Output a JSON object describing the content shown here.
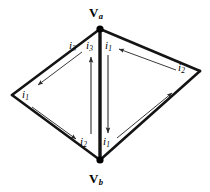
{
  "figure": {
    "type": "circuit-graph-diagram",
    "background_color": "#ffffff",
    "stroke_color": "#1a1a1a",
    "arrow_color": "#3a3a3a"
  },
  "nodes": [
    {
      "id": "va",
      "name": "node-va",
      "symbol": "V",
      "subscript": "a",
      "x": 100,
      "y": 29,
      "label_x": 89,
      "label_y": 7
    },
    {
      "id": "vb",
      "name": "node-vb",
      "symbol": "V",
      "subscript": "b",
      "x": 100,
      "y": 160,
      "label_x": 89,
      "label_y": 172
    },
    {
      "id": "vleft",
      "name": "node-left",
      "symbol": "",
      "subscript": "",
      "x": 12,
      "y": 95
    },
    {
      "id": "vright",
      "name": "node-right",
      "symbol": "",
      "subscript": "",
      "x": 200,
      "y": 71
    }
  ],
  "edges": [
    {
      "id": "edge-va-left",
      "from": "va",
      "to": "vleft",
      "x1": 100,
      "y1": 29,
      "x2": 12,
      "y2": 95
    },
    {
      "id": "edge-left-vb",
      "from": "vleft",
      "to": "vb",
      "x1": 12,
      "y1": 95,
      "x2": 100,
      "y2": 160
    },
    {
      "id": "edge-va-right",
      "from": "va",
      "to": "vright",
      "x1": 100,
      "y1": 29,
      "x2": 200,
      "y2": 71
    },
    {
      "id": "edge-right-vb",
      "from": "vright",
      "to": "vb",
      "x1": 200,
      "y1": 71,
      "x2": 100,
      "y2": 160
    },
    {
      "id": "edge-va-vb",
      "from": "va",
      "to": "vb",
      "x1": 100,
      "y1": 29,
      "x2": 100,
      "y2": 160
    }
  ],
  "currents": [
    {
      "id": "current-upper-left",
      "name": "current-arrow-upper-left",
      "symbol": "i",
      "subscript": "3",
      "direction": "down-left",
      "x1": 82,
      "y1": 52,
      "x2": 38,
      "y2": 85,
      "label_x": 72,
      "label_y": 42
    },
    {
      "id": "current-lower-left",
      "name": "current-arrow-lower-left",
      "symbol": "i",
      "subscript": "2",
      "direction": "down-right",
      "x1": 32,
      "y1": 107,
      "x2": 76,
      "y2": 139,
      "label_x": 82,
      "label_y": 138
    },
    {
      "id": "current-upper-right",
      "name": "current-arrow-upper-right",
      "symbol": "i",
      "subscript": "2",
      "direction": "up-left",
      "x1": 176,
      "y1": 70,
      "x2": 119,
      "y2": 49,
      "label_x": 176,
      "label_y": 66
    },
    {
      "id": "current-lower-right",
      "name": "current-arrow-lower-right",
      "symbol": "i",
      "subscript": "1",
      "direction": "up-right",
      "x1": 117,
      "y1": 138,
      "x2": 172,
      "y2": 93,
      "label_x": 105,
      "label_y": 138
    },
    {
      "id": "current-center-left",
      "name": "current-arrow-center-up",
      "symbol": "i",
      "subscript": "3",
      "direction": "up",
      "x1": 91,
      "y1": 134,
      "x2": 91,
      "y2": 57,
      "label_x": 86,
      "label_y": 42
    },
    {
      "id": "current-center-right",
      "name": "current-arrow-center-down",
      "symbol": "i",
      "subscript": "1",
      "direction": "down",
      "x1": 108,
      "y1": 55,
      "x2": 108,
      "y2": 133,
      "label_x": 105,
      "label_y": 42
    }
  ],
  "labels": {
    "top_vertex": "V",
    "top_vertex_sub": "a",
    "bottom_vertex": "V",
    "bottom_vertex_sub": "b",
    "i1": "i",
    "i1_sub": "1",
    "i2": "i",
    "i2_sub": "2",
    "i3": "i",
    "i3_sub": "3"
  }
}
